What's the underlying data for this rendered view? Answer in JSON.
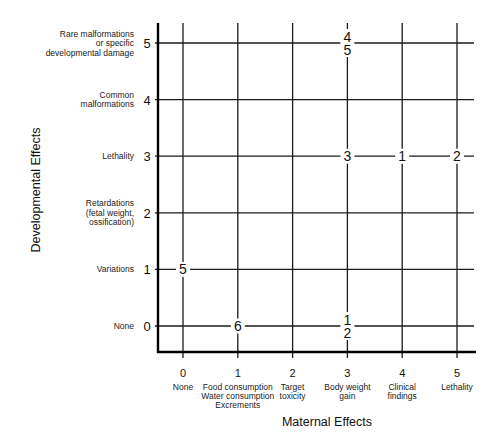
{
  "chart_data": {
    "type": "scatter",
    "title": "",
    "xlabel": "Maternal Effects",
    "ylabel": "Developmental Effects",
    "x_ticks": [
      0,
      1,
      2,
      3,
      4,
      5
    ],
    "x_tick_labels": [
      [
        "None"
      ],
      [
        "Food consumption",
        "Water consumption",
        "Excrements"
      ],
      [
        "Target",
        "toxicity"
      ],
      [
        "Body weight",
        "gain"
      ],
      [
        "Clinical",
        "findings"
      ],
      [
        "Lethality"
      ]
    ],
    "y_ticks": [
      0,
      1,
      2,
      3,
      4,
      5
    ],
    "y_tick_labels": [
      [
        "None"
      ],
      [
        "Variations"
      ],
      [
        "Retardations",
        "(fetal weight,",
        "ossification)"
      ],
      [
        "Lethality"
      ],
      [
        "Common",
        "malformations"
      ],
      [
        "Rare malformations",
        "or specific",
        "developmental damage"
      ]
    ],
    "xlim": [
      0,
      5
    ],
    "ylim": [
      0,
      5
    ],
    "grid": true,
    "legend": "none",
    "points": [
      {
        "x": 3,
        "y": 5,
        "labels": [
          "4",
          "5"
        ]
      },
      {
        "x": 3,
        "y": 3,
        "labels": [
          "3"
        ]
      },
      {
        "x": 4,
        "y": 3,
        "labels": [
          "1"
        ]
      },
      {
        "x": 5,
        "y": 3,
        "labels": [
          "2"
        ]
      },
      {
        "x": 0,
        "y": 1,
        "labels": [
          "5"
        ]
      },
      {
        "x": 1,
        "y": 0,
        "labels": [
          "6"
        ]
      },
      {
        "x": 3,
        "y": 0,
        "labels": [
          "1",
          "2"
        ]
      }
    ]
  }
}
